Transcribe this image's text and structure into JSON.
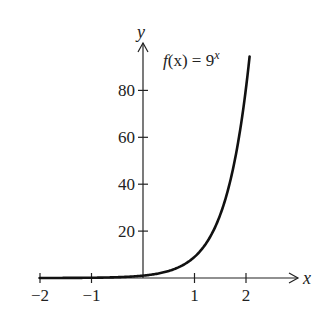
{
  "chart_data": {
    "type": "line",
    "title": "",
    "function": "f(x) = 9^x",
    "annotation": {
      "prefix": "f",
      "arg": "(x) = 9",
      "exponent": "x"
    },
    "xlabel": "x",
    "ylabel": "y",
    "xlim": [
      -2,
      2.07
    ],
    "ylim": [
      0,
      95
    ],
    "x_ticks": [
      -2,
      -1,
      1,
      2
    ],
    "x_tick_labels": [
      "−2",
      "−1",
      "1",
      "2"
    ],
    "y_ticks": [
      20,
      40,
      60,
      80
    ],
    "y_tick_labels": [
      "20",
      "40",
      "60",
      "80"
    ],
    "grid": false,
    "legend": "none",
    "series": [
      {
        "name": "f(x) = 9^x",
        "x": [
          -2,
          -1.5,
          -1,
          -0.5,
          0,
          0.5,
          1,
          1.25,
          1.5,
          1.75,
          2,
          2.07
        ],
        "values": [
          0.012,
          0.037,
          0.111,
          0.333,
          1,
          3,
          9,
          15.6,
          27,
          46.8,
          81,
          94.7
        ]
      }
    ]
  },
  "pixel_map": {
    "x0": 143,
    "px_per_x": 51.5,
    "y0": 278,
    "px_per_y": 2.345,
    "x_axis_start": 38,
    "x_axis_end": 298,
    "y_axis_top": 43
  }
}
